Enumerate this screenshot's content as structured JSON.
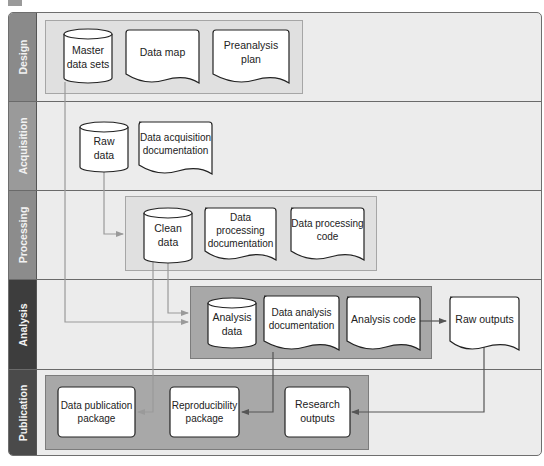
{
  "lanes": [
    {
      "id": "design",
      "label": "Design",
      "color": "#8a8a8a"
    },
    {
      "id": "acquisition",
      "label": "Acquisition",
      "color": "#9a9a9a"
    },
    {
      "id": "processing",
      "label": "Processing",
      "color": "#8c8c8c"
    },
    {
      "id": "analysis",
      "label": "Analysis",
      "color": "#3d3d3d"
    },
    {
      "id": "publication",
      "label": "Publication",
      "color": "#4a4a4a"
    }
  ],
  "nodes": {
    "master_data_sets": {
      "label": "Master\ndata sets",
      "shape": "database",
      "lane": "design"
    },
    "data_map": {
      "label": "Data map",
      "shape": "document",
      "lane": "design"
    },
    "preanalysis_plan": {
      "label": "Preanalysis\nplan",
      "shape": "document",
      "lane": "design"
    },
    "raw_data": {
      "label": "Raw\ndata",
      "shape": "database",
      "lane": "acquisition"
    },
    "data_acquisition_documentation": {
      "label": "Data acquisition\ndocumentation",
      "shape": "document",
      "lane": "acquisition"
    },
    "clean_data": {
      "label": "Clean\ndata",
      "shape": "database",
      "lane": "processing"
    },
    "data_processing_documentation": {
      "label": "Data processing\ndocumentation",
      "shape": "document",
      "lane": "processing"
    },
    "data_processing_code": {
      "label": "Data processing\ncode",
      "shape": "document",
      "lane": "processing"
    },
    "analysis_data": {
      "label": "Analysis\ndata",
      "shape": "database",
      "lane": "analysis"
    },
    "data_analysis_documentation": {
      "label": "Data analysis\ndocumentation",
      "shape": "document",
      "lane": "analysis"
    },
    "analysis_code": {
      "label": "Analysis code",
      "shape": "document",
      "lane": "analysis"
    },
    "raw_outputs": {
      "label": "Raw outputs",
      "shape": "document",
      "lane": "analysis"
    },
    "data_publication_package": {
      "label": "Data publication\npackage",
      "shape": "rounded-rect",
      "lane": "publication"
    },
    "reproducibility_package": {
      "label": "Reproducibility\npackage",
      "shape": "rounded-rect",
      "lane": "publication"
    },
    "research_outputs": {
      "label": "Research\noutputs",
      "shape": "rounded-rect",
      "lane": "publication"
    }
  },
  "edges": [
    {
      "from": "master_data_sets",
      "to": "analysis_group",
      "style": "light"
    },
    {
      "from": "raw_data",
      "to": "processing_group",
      "style": "light"
    },
    {
      "from": "clean_data",
      "to": "analysis_group",
      "style": "light"
    },
    {
      "from": "clean_data",
      "to": "data_publication_package",
      "style": "light"
    },
    {
      "from": "data_analysis_documentation",
      "to": "reproducibility_package",
      "style": "dark"
    },
    {
      "from": "analysis_code",
      "to": "raw_outputs",
      "style": "dark"
    },
    {
      "from": "raw_outputs",
      "to": "research_outputs",
      "style": "dark"
    }
  ]
}
